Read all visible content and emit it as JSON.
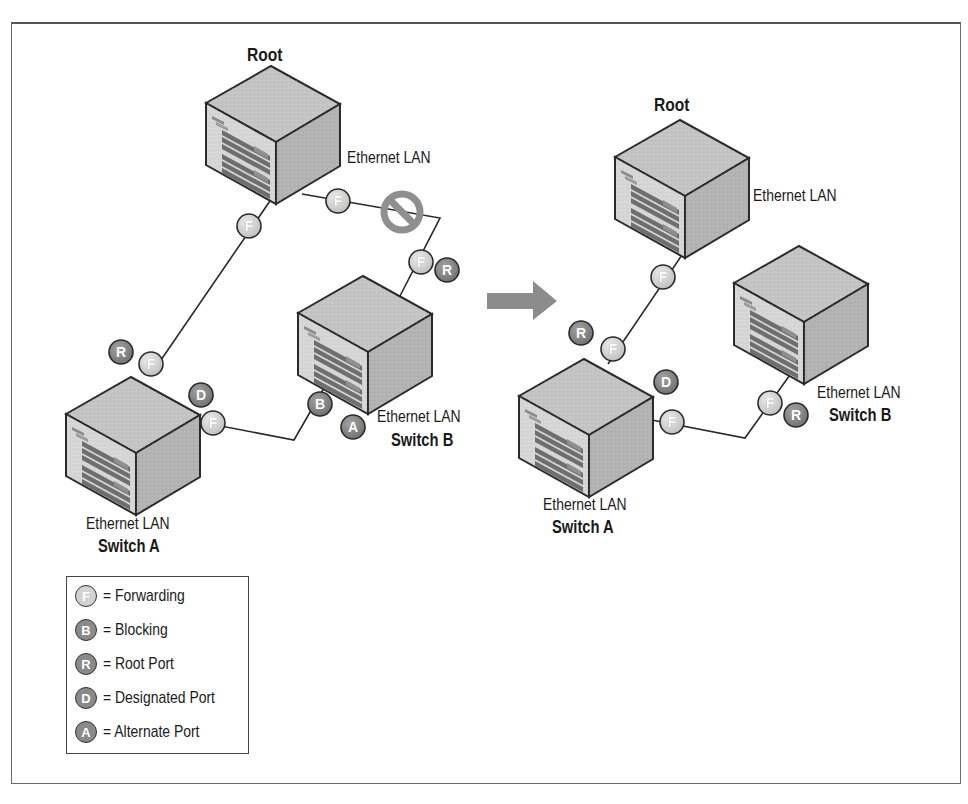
{
  "colors": {
    "forwarding_fill": "#d2d2d2",
    "dark_port_fill": "#8a8a8a",
    "switch_top": "#c4c4c4",
    "switch_front": "#d6d6d6",
    "switch_side": "#b0b0b0",
    "arrow": "#8c8c8c",
    "blocked_symbol": "#8f8f8f",
    "line": "#2a2a2a"
  },
  "before": {
    "root": {
      "title": "Root",
      "lan_label": "Ethernet LAN"
    },
    "switch_a": {
      "lan_label": "Ethernet LAN",
      "name": "Switch A"
    },
    "switch_b": {
      "lan_label": "Ethernet LAN",
      "name": "Switch B"
    },
    "ports": {
      "root_to_a": "F",
      "root_to_b": "F",
      "b_upper_f": "F",
      "b_upper_r": "R",
      "a_upper_r": "R",
      "a_upper_f": "F",
      "a_right_d": "D",
      "a_right_f": "F",
      "b_lower_b": "B",
      "b_lower_a": "A"
    },
    "blocked_link_icon": "no-entry-icon"
  },
  "arrow_icon": "right-arrow-icon",
  "after": {
    "root": {
      "title": "Root",
      "lan_label": "Ethernet LAN"
    },
    "switch_a": {
      "lan_label": "Ethernet LAN",
      "name": "Switch A"
    },
    "switch_b": {
      "lan_label": "Ethernet LAN",
      "name": "Switch B"
    },
    "ports": {
      "root_to_a": "F",
      "a_upper_r": "R",
      "a_upper_f": "F",
      "a_right_d": "D",
      "a_right_f": "F",
      "b_lower_f": "F",
      "b_lower_r": "R"
    }
  },
  "legend": {
    "items": [
      {
        "letter": "F",
        "label": "= Forwarding",
        "style": "light"
      },
      {
        "letter": "B",
        "label": "= Blocking",
        "style": "dark"
      },
      {
        "letter": "R",
        "label": "= Root Port",
        "style": "dark"
      },
      {
        "letter": "D",
        "label": "= Designated Port",
        "style": "dark"
      },
      {
        "letter": "A",
        "label": "= Alternate Port",
        "style": "dark"
      }
    ]
  }
}
